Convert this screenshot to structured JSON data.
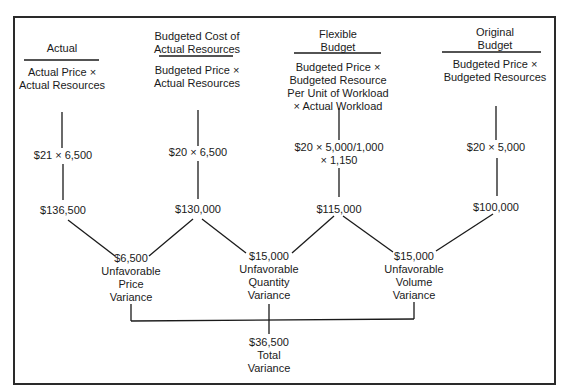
{
  "columns": [
    {
      "header": [
        "Actual"
      ],
      "formula": [
        "Actual Price ×",
        "Actual Resources"
      ],
      "calc": [
        "$21 × 6,500"
      ],
      "amount": "$136,500"
    },
    {
      "header": [
        "Budgeted Cost of",
        "Actual Resources"
      ],
      "formula": [
        "Budgeted Price ×",
        "Actual Resources"
      ],
      "calc": [
        "$20 × 6,500"
      ],
      "amount": "$130,000"
    },
    {
      "header": [
        "Flexible",
        "Budget"
      ],
      "formula": [
        "Budgeted Price ×",
        "Budgeted Resource",
        "Per Unit of Workload",
        "× Actual Workload"
      ],
      "calc": [
        "$20 × 5,000/1,000",
        "× 1,150"
      ],
      "amount": "$115,000"
    },
    {
      "header": [
        "Original",
        "Budget"
      ],
      "formula": [
        "Budgeted Price ×",
        "Budgeted Resources"
      ],
      "calc": [
        "$20 × 5,000"
      ],
      "amount": "$100,000"
    }
  ],
  "variances": [
    {
      "lines": [
        "$6,500",
        "Unfavorable",
        "Price",
        "Variance"
      ]
    },
    {
      "lines": [
        "$15,000",
        "Unfavorable",
        "Quantity",
        "Variance"
      ]
    },
    {
      "lines": [
        "$15,000",
        "Unfavorable",
        "Volume",
        "Variance"
      ]
    }
  ],
  "total": {
    "lines": [
      "$36,500",
      "Total",
      "Variance"
    ]
  },
  "colors": {
    "ink": "#1a1a1a",
    "background": "#ffffff"
  }
}
